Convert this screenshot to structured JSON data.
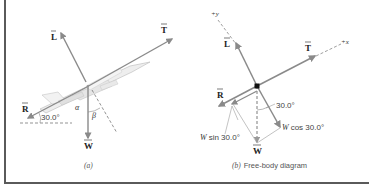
{
  "panel_a": {
    "caption": "(a)",
    "vectors": {
      "L": "L",
      "T": "T",
      "R": "R",
      "W": "W"
    },
    "angle_label": "30.0°",
    "alpha": "α",
    "beta": "β"
  },
  "panel_b": {
    "caption_prefix": "(b)",
    "caption_text": "Free-body diagram",
    "axis_x": "+x",
    "axis_y": "+y",
    "vectors": {
      "L": "L",
      "T": "T",
      "R": "R",
      "W": "W"
    },
    "angle_label": "30.0°",
    "w_cos_label": "W cos 30.0°",
    "w_sin_label": "W sin 30.0°"
  },
  "colors": {
    "vector": "#8a8a8a",
    "frame": "#5a5a5a"
  }
}
